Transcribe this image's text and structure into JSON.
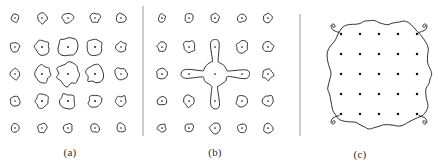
{
  "figure": {
    "background_color": "#ffffff",
    "ink_color": "#1b1b1b",
    "dot_color": "#111111",
    "divider_color": "#8c8c8c",
    "stroke_width": 0.9,
    "width": 438,
    "height": 168,
    "panel_count": 3
  },
  "panels": [
    {
      "id": "panel-a",
      "caption": "(a)",
      "caption_x": 70,
      "caption_y": 152,
      "origin_x": 8,
      "origin_y": 12,
      "grid_rows": 5,
      "grid_cols": 5,
      "grid_x": [
        15,
        42,
        68,
        95,
        121
      ],
      "grid_y": [
        18,
        47,
        74,
        101,
        128
      ],
      "blob_state": "separate",
      "note": "Each grid dot is surrounded by its own closed wobbly contour; contour radius peaks at the grid center and decays outward",
      "radii": [
        [
          4.2,
          5.0,
          5.4,
          4.8,
          4.6
        ],
        [
          4.6,
          7.4,
          9.6,
          7.6,
          5.4
        ],
        [
          5.0,
          8.4,
          11.2,
          8.6,
          6.0
        ],
        [
          4.8,
          6.6,
          7.4,
          6.4,
          5.2
        ],
        [
          4.0,
          4.6,
          4.4,
          4.4,
          4.6
        ]
      ]
    },
    {
      "id": "panel-b",
      "caption": "(b)",
      "caption_x": 215,
      "caption_y": 152,
      "origin_x": 155,
      "origin_y": 12,
      "grid_rows": 5,
      "grid_cols": 5,
      "grid_x": [
        162,
        189,
        215,
        242,
        268
      ],
      "grid_y": [
        18,
        47,
        74,
        101,
        128
      ],
      "blob_state": "center-cluster-merged",
      "merged_cells": [
        [
          2,
          2
        ],
        [
          1,
          2
        ],
        [
          3,
          2
        ],
        [
          2,
          1
        ],
        [
          2,
          3
        ]
      ],
      "note": "The centre blob and its four orthogonal neighbours have fused into a single plus-shaped contour with narrow necks and teardrop lobes",
      "radii": [
        [
          4.0,
          4.4,
          4.4,
          4.2,
          4.4
        ],
        [
          4.8,
          6.0,
          6.2,
          6.0,
          5.2
        ],
        [
          5.2,
          6.4,
          13.0,
          6.6,
          5.4
        ],
        [
          4.8,
          5.6,
          6.2,
          5.6,
          5.2
        ],
        [
          4.0,
          4.4,
          4.8,
          4.4,
          4.6
        ]
      ]
    },
    {
      "id": "panel-c",
      "caption": "(c)",
      "caption_x": 360,
      "caption_y": 154,
      "origin_x": 312,
      "origin_y": 12,
      "grid_rows": 5,
      "grid_cols": 5,
      "grid_x": [
        341,
        360,
        379,
        398,
        417
      ],
      "grid_y": [
        34,
        54,
        74,
        94,
        114
      ],
      "blob_state": "all-merged",
      "note": "All twenty-five dots are enclosed by one large rounded-square contour with a wavy boundary and small curled horn protrusions at each corner",
      "outline_center_x": 379,
      "outline_center_y": 74,
      "outline_half_width": 50,
      "outline_half_height": 52,
      "corner_horns": 4
    }
  ],
  "dividers": [
    {
      "id": "divider-1",
      "x": 143,
      "y_top": 6,
      "y_bottom": 136
    },
    {
      "id": "divider-2",
      "x": 300,
      "y_top": 14,
      "y_bottom": 136
    }
  ]
}
